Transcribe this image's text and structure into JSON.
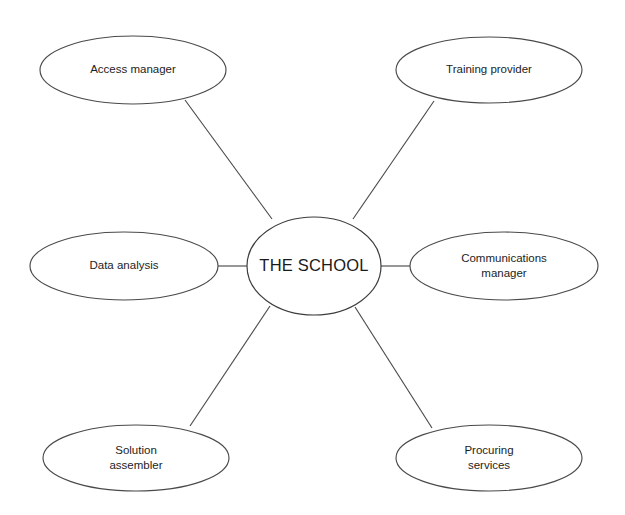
{
  "diagram": {
    "type": "hub-and-spoke",
    "background_color": "#ffffff",
    "stroke_color": "#4a4a4a",
    "text_color": "#1d1d1d",
    "hub": {
      "label": "THE SCHOOL",
      "cx": 314,
      "cy": 266,
      "rx": 67,
      "ry": 49
    },
    "nodes": [
      {
        "id": "access-manager",
        "label_line1": "Access manager",
        "label_line2": "",
        "cx": 133,
        "cy": 70,
        "rx": 93,
        "ry": 34,
        "line": {
          "x1": 185,
          "y1": 100,
          "x2": 272,
          "y2": 219
        }
      },
      {
        "id": "training-provider",
        "label_line1": "Training provider",
        "label_line2": "",
        "cx": 489,
        "cy": 70,
        "rx": 93,
        "ry": 33,
        "line": {
          "x1": 434,
          "y1": 101,
          "x2": 353,
          "y2": 219
        }
      },
      {
        "id": "data-analysis",
        "label_line1": "Data analysis",
        "label_line2": "",
        "cx": 124,
        "cy": 266,
        "rx": 94,
        "ry": 34,
        "line": {
          "x1": 218,
          "y1": 266,
          "x2": 248,
          "y2": 266
        }
      },
      {
        "id": "communications-manager",
        "label_line1": "Communications",
        "label_line2": "manager",
        "cx": 504,
        "cy": 266,
        "rx": 94,
        "ry": 34,
        "line": {
          "x1": 381,
          "y1": 266,
          "x2": 410,
          "y2": 266
        }
      },
      {
        "id": "solution-assembler",
        "label_line1": "Solution",
        "label_line2": "assembler",
        "cx": 136,
        "cy": 458,
        "rx": 93,
        "ry": 33,
        "line": {
          "x1": 270,
          "y1": 306,
          "x2": 190,
          "y2": 426
        }
      },
      {
        "id": "procuring-services",
        "label_line1": "Procuring",
        "label_line2": "services",
        "cx": 489,
        "cy": 458,
        "rx": 93,
        "ry": 33,
        "line": {
          "x1": 355,
          "y1": 307,
          "x2": 432,
          "y2": 428
        }
      }
    ]
  }
}
